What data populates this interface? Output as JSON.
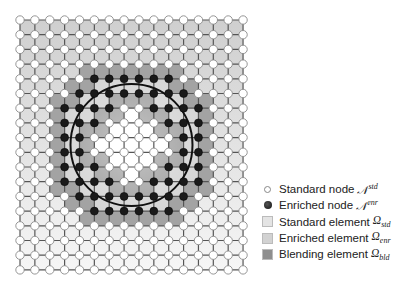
{
  "grid": {
    "cols": 16,
    "rows": 18,
    "x0": 20,
    "y0": 20,
    "dx": 14.87,
    "dy": 14.7,
    "enriched_nodes": {
      "4": [
        5,
        6,
        7,
        8,
        9,
        10
      ],
      "5": [
        4,
        5,
        6,
        7,
        8,
        9,
        10,
        11
      ],
      "6": [
        3,
        4,
        5,
        6,
        9,
        10,
        11,
        12
      ],
      "7": [
        3,
        4,
        5,
        10,
        11,
        12
      ],
      "8": [
        3,
        4,
        11,
        12
      ],
      "9": [
        3,
        4,
        11,
        12
      ],
      "10": [
        3,
        4,
        5,
        10,
        11,
        12
      ],
      "11": [
        3,
        4,
        5,
        6,
        9,
        10,
        11,
        12
      ],
      "12": [
        4,
        5,
        6,
        7,
        8,
        9,
        10,
        11
      ],
      "13": [
        5,
        6,
        7,
        8,
        9,
        10
      ]
    }
  },
  "circle": {
    "cx": 131.5,
    "cy": 145,
    "r": 61
  },
  "colors": {
    "standard_top": "#cfcfcf",
    "standard_bottom": "#f6f6f6",
    "enriched": "#d6d6d6",
    "blending": "#a3a3a3",
    "inside": "#ffffff",
    "grid_line": "#555555",
    "node_fill": "#ffffff",
    "node_stroke": "#8a8a8a",
    "enriched_node": "#1a1a1a",
    "circle": "#111111"
  },
  "legend": [
    {
      "icon": "standard-node-icon",
      "label": "Standard node",
      "math": "𝒩",
      "sup": "std",
      "sub": ""
    },
    {
      "icon": "enriched-node-icon",
      "label": "Enriched node",
      "math": "𝒩",
      "sup": "enr",
      "sub": ""
    },
    {
      "icon": "standard-element-swatch",
      "label": "Standard element",
      "math": "Ω",
      "sup": "",
      "sub": "std",
      "color": "#e4e4e4"
    },
    {
      "icon": "enriched-element-swatch",
      "label": "Enriched element",
      "math": "Ω",
      "sup": "",
      "sub": "enr",
      "color": "#d2d2d2"
    },
    {
      "icon": "blending-element-swatch",
      "label": "Blending element",
      "math": "Ω",
      "sup": "",
      "sub": "bld",
      "color": "#8e8e8e"
    }
  ]
}
